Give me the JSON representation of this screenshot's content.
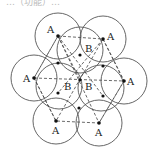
{
  "header": {
    "clipped_text": "…（功能）…"
  },
  "diagram": {
    "title": "",
    "circle_radius": 23,
    "a_points": [
      {
        "label": "A",
        "cx": 58,
        "cy": 36,
        "lx": 47,
        "ly": 33
      },
      {
        "label": "A",
        "cx": 103,
        "cy": 39,
        "lx": 107,
        "ly": 39
      },
      {
        "label": "A",
        "cx": 34,
        "cy": 78,
        "lx": 23,
        "ly": 82
      },
      {
        "label": "A",
        "cx": 124,
        "cy": 81,
        "lx": 128,
        "ly": 85
      },
      {
        "label": "A",
        "cx": 56,
        "cy": 121,
        "lx": 52,
        "ly": 133
      },
      {
        "label": "A",
        "cx": 99,
        "cy": 123,
        "lx": 96,
        "ly": 135
      }
    ],
    "b_points": [
      {
        "label": "B",
        "cx": 80,
        "cy": 53,
        "lx": 83,
        "ly": 51
      },
      {
        "label": "B",
        "cx": 67,
        "cy": 86,
        "lx": 63,
        "ly": 89
      },
      {
        "label": "B",
        "cx": 91,
        "cy": 87,
        "lx": 85,
        "ly": 90
      }
    ],
    "small_dots": [
      {
        "x": 80,
        "y": 53
      },
      {
        "x": 58,
        "y": 63
      },
      {
        "x": 103,
        "y": 66
      },
      {
        "x": 58,
        "y": 93
      },
      {
        "x": 103,
        "y": 96
      },
      {
        "x": 79,
        "y": 108
      },
      {
        "x": 80,
        "y": 80
      }
    ],
    "colors": {
      "stroke": "#555555",
      "dot": "#111111",
      "text": "#222222"
    }
  }
}
